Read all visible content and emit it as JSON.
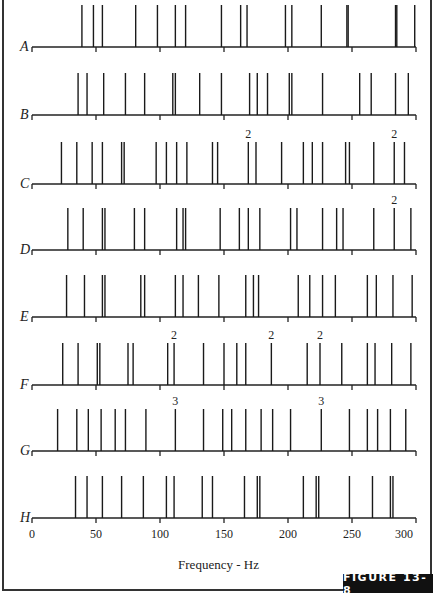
{
  "chart_data": {
    "type": "scatter",
    "subtype": "spectral-line-plot",
    "xlabel": "Frequency - Hz",
    "ylabel": "",
    "xlim": [
      0,
      300
    ],
    "xticks": [
      0,
      50,
      100,
      150,
      200,
      250,
      300
    ],
    "grid": false,
    "legend": null,
    "rows": [
      {
        "name": "A",
        "lines": [
          39,
          48,
          55,
          81,
          98,
          112,
          120,
          148,
          163,
          168,
          198,
          203,
          226,
          246,
          247,
          284,
          285,
          299
        ],
        "labels": []
      },
      {
        "name": "B",
        "lines": [
          36,
          43,
          56,
          73,
          88,
          110,
          112,
          131,
          148,
          170,
          176,
          184,
          201,
          203,
          227,
          256,
          265,
          284,
          294
        ],
        "labels": []
      },
      {
        "name": "C",
        "lines": [
          23,
          35,
          47,
          55,
          70,
          72,
          97,
          105,
          113,
          121,
          141,
          145,
          169,
          175,
          195,
          212,
          219,
          227,
          245,
          248,
          267,
          283,
          291
        ],
        "labels": [
          {
            "x": 169,
            "text": "2"
          },
          {
            "x": 283,
            "text": "2"
          }
        ]
      },
      {
        "name": "D",
        "lines": [
          28,
          40,
          55,
          57,
          80,
          88,
          113,
          118,
          120,
          147,
          162,
          169,
          178,
          202,
          207,
          227,
          238,
          243,
          267,
          283,
          296
        ],
        "labels": [
          {
            "x": 283,
            "text": "2"
          }
        ]
      },
      {
        "name": "E",
        "lines": [
          27,
          41,
          55,
          57,
          85,
          88,
          112,
          118,
          130,
          146,
          167,
          173,
          177,
          208,
          217,
          227,
          237,
          262,
          269,
          282,
          297
        ],
        "labels": []
      },
      {
        "name": "F",
        "lines": [
          24,
          36,
          51,
          53,
          75,
          79,
          106,
          111,
          134,
          150,
          160,
          167,
          187,
          215,
          225,
          242,
          262,
          268,
          281,
          296
        ],
        "labels": [
          {
            "x": 111,
            "text": "2"
          },
          {
            "x": 187,
            "text": "2"
          },
          {
            "x": 225,
            "text": "2"
          }
        ]
      },
      {
        "name": "G",
        "lines": [
          20,
          35,
          44,
          54,
          65,
          73,
          89,
          112,
          134,
          149,
          156,
          167,
          179,
          188,
          202,
          226,
          248,
          262,
          270,
          280,
          292
        ],
        "labels": [
          {
            "x": 112,
            "text": "3"
          },
          {
            "x": 226,
            "text": "3"
          }
        ]
      },
      {
        "name": "H",
        "lines": [
          34,
          43,
          55,
          70,
          87,
          105,
          111,
          133,
          141,
          166,
          176,
          178,
          212,
          222,
          224,
          248,
          266,
          280,
          282
        ],
        "labels": []
      }
    ]
  },
  "figure": {
    "label": "FIGURE 13-8",
    "xlabel": "Frequency - Hz"
  }
}
